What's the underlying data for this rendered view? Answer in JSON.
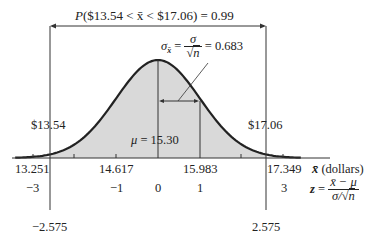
{
  "title": {
    "prob_prefix": "P",
    "prob_text": "($13.54 < x̄ < $17.06) = 0.99"
  },
  "sigma_annotation": {
    "lhs": "σ",
    "lhs_sub": "x̄",
    "num": "σ",
    "den_sym": "√",
    "den_var": "n",
    "value": "= 0.683"
  },
  "interval_labels": {
    "left": "$13.54",
    "right": "$17.06"
  },
  "mean_label": {
    "symbol": "μ",
    "text": "= 15.30"
  },
  "x_axis": {
    "ticks": [
      "13.251",
      "14.617",
      "15.983",
      "17.349"
    ],
    "unit_symbol": "x̄",
    "unit_text": "(dollars)"
  },
  "z_axis": {
    "ticks": [
      "−3",
      "−1",
      "0",
      "1",
      "3"
    ],
    "critical": [
      "−2.575",
      "2.575"
    ],
    "formula_lhs": "z",
    "formula_num": "x̄ − μ",
    "formula_den_left": "σ/",
    "formula_den_var": "n"
  },
  "chart_data": {
    "type": "area",
    "title": "P($13.54 < x̄ < $17.06) = 0.99",
    "distribution": "normal",
    "mean": 15.3,
    "std_error": 0.683,
    "shaded_interval": [
      13.54,
      17.06
    ],
    "probability": 0.99,
    "x_ticks": [
      13.251,
      14.617,
      15.983,
      17.349
    ],
    "z_ticks": [
      -3,
      -1,
      0,
      1,
      3
    ],
    "z_critical": [
      -2.575,
      2.575
    ],
    "xlabel": "x̄ (dollars)",
    "zlabel": "z = (x̄ − μ)/(σ/√n)"
  },
  "colors": {
    "fill": "#d9d9d9",
    "curve": "#222222",
    "line": "#333333"
  }
}
